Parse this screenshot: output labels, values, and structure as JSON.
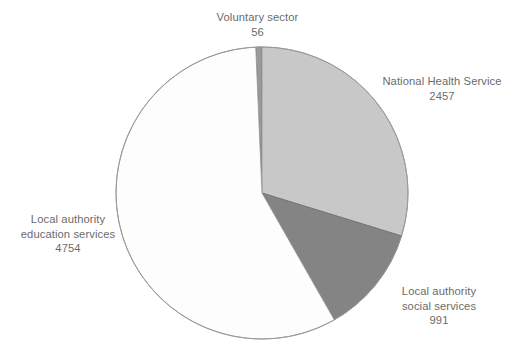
{
  "chart_data": {
    "type": "pie",
    "title": "",
    "subtitle": "",
    "xlabel": "",
    "ylabel": "",
    "grid": false,
    "legend": "none",
    "labels_position": "outside-with-values",
    "total": 8258,
    "start_angle_deg": -90,
    "direction": "clockwise",
    "categories": [
      "Voluntary sector",
      "National Health Service",
      "Local authority social services",
      "Local authority education services"
    ],
    "values": [
      56,
      2457,
      991,
      4754
    ],
    "slices": [
      {
        "name": "voluntary-sector",
        "label_line1": "Voluntary sector",
        "label_line2": "",
        "value_text": "56",
        "value": 56,
        "color": "#9a9a9a",
        "stroke": "#6f6f6f",
        "angle_deg": 2.44,
        "percent": 0.68
      },
      {
        "name": "national-health-service",
        "label_line1": "National Health Service",
        "label_line2": "",
        "value_text": "2457",
        "value": 2457,
        "color": "#c8c8c8",
        "stroke": "#9a9a9a",
        "angle_deg": 107.13,
        "percent": 29.75
      },
      {
        "name": "local-authority-social-services",
        "label_line1": "Local authority",
        "label_line2": "social services",
        "value_text": "991",
        "value": 991,
        "color": "#848484",
        "stroke": "#6f6f6f",
        "angle_deg": 43.2,
        "percent": 12.0
      },
      {
        "name": "local-authority-education-services",
        "label_line1": "Local authority",
        "label_line2": "education services",
        "value_text": "4754",
        "value": 4754,
        "color": "#fdfdfd",
        "stroke": "#9a9a9a",
        "angle_deg": 207.23,
        "percent": 57.57
      }
    ],
    "geometry": {
      "center_x": 262,
      "center_y": 193,
      "radius": 146
    },
    "colors": {
      "background": "#ffffff",
      "label_text": "#6b6b6b",
      "outline": "#9a9a9a"
    }
  }
}
